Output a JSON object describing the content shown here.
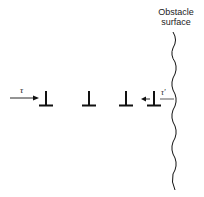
{
  "diagram": {
    "title_lines": [
      "Obstacle",
      "surface"
    ],
    "applied_stress_label": "τ",
    "back_stress_label": "τ'",
    "dislocation_symbol": "⊥",
    "dislocations": [
      {
        "x": 47,
        "label": ""
      },
      {
        "x": 89,
        "label": ""
      },
      {
        "x": 126,
        "label": ""
      },
      {
        "x": 153,
        "label": ""
      }
    ],
    "colors": {
      "ink": "#111111",
      "background": "#ffffff"
    }
  }
}
